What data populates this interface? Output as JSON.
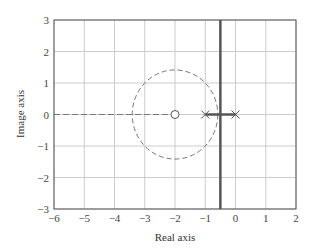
{
  "chart_data": {
    "type": "root-locus",
    "title": "",
    "xlabel": "Real axis",
    "ylabel": "Image axis",
    "xlim": [
      -6,
      2
    ],
    "ylim": [
      -3,
      3
    ],
    "xticks": [
      -6,
      -5,
      -4,
      -3,
      -2,
      -1,
      0,
      1,
      2
    ],
    "yticks": [
      -3,
      -2,
      -1,
      0,
      1,
      2,
      3
    ],
    "grid": true,
    "poles": [
      {
        "x": -1,
        "y": 0
      },
      {
        "x": 0,
        "y": 0
      }
    ],
    "zeros": [
      {
        "x": -2,
        "y": 0
      }
    ],
    "solid_locus": [
      {
        "name": "real-axis segment",
        "points": [
          [
            -1,
            0
          ],
          [
            0,
            0
          ]
        ]
      },
      {
        "name": "vertical asymptote branch",
        "points": [
          [
            -0.5,
            -3
          ],
          [
            -0.5,
            3
          ]
        ]
      }
    ],
    "dashed_locus": [
      {
        "name": "circle",
        "center": [
          -2,
          0
        ],
        "radius": 1.414
      },
      {
        "name": "real-axis left",
        "points": [
          [
            -6,
            0
          ],
          [
            -2,
            0
          ]
        ]
      }
    ],
    "colors": {
      "solid": "#555555",
      "dashed": "#777777",
      "grid": "#cccccc",
      "frame": "#555555"
    }
  }
}
